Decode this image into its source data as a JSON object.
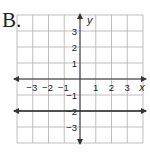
{
  "option_label": "B.",
  "chart_data": {
    "type": "line",
    "title": "",
    "xlabel": "x",
    "ylabel": "y",
    "xlim": [
      -4,
      4
    ],
    "ylim": [
      -4,
      4
    ],
    "grid": true,
    "x_tick_labels": [
      "-3",
      "-2",
      "-1",
      "1",
      "2",
      "3"
    ],
    "y_tick_labels": [
      "3",
      "2",
      "1",
      "-1",
      "-2",
      "-3"
    ],
    "series": [
      {
        "name": "y = -2",
        "equation": "y = -2",
        "x": [
          -4,
          4
        ],
        "y": [
          -2,
          -2
        ],
        "arrows": "both"
      }
    ]
  }
}
